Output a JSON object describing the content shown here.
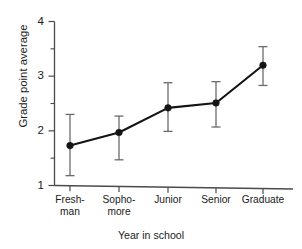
{
  "chart_data": {
    "type": "line",
    "title": "",
    "xlabel": "Year in school",
    "ylabel": "Grade point average",
    "categories": [
      "Fresh-\nman",
      "Sopho-\nmore",
      "Junior",
      "Senior",
      "Graduate"
    ],
    "categories_flat": [
      "Freshman",
      "Sophomore",
      "Junior",
      "Senior",
      "Graduate"
    ],
    "values": [
      1.73,
      1.97,
      2.42,
      2.51,
      3.2
    ],
    "error_low": [
      1.18,
      1.47,
      1.99,
      2.07,
      2.83
    ],
    "error_high": [
      2.3,
      2.27,
      2.88,
      2.9,
      3.54
    ],
    "ylim": [
      1,
      4
    ],
    "xlim": [
      0,
      6
    ],
    "ytick_labels": [
      "1",
      "2",
      "3",
      "4"
    ],
    "ytick_values": [
      1,
      2,
      3,
      4
    ],
    "yminor_values": [
      1.5,
      2.5,
      3.5
    ],
    "grid": false,
    "legend": null,
    "legend_position": "none",
    "series": [
      {
        "name": "Grade point average",
        "values": [
          1.73,
          1.97,
          2.42,
          2.51,
          3.2
        ],
        "error_low": [
          1.18,
          1.47,
          1.99,
          2.07,
          2.83
        ],
        "error_high": [
          2.3,
          2.27,
          2.88,
          2.9,
          3.54
        ],
        "marker": "filled-circle",
        "color": "#141414"
      }
    ],
    "colors": {
      "line": "#141414",
      "marker": "#141414",
      "error_bar": "#6b6b6b",
      "axis": "#4a4a4a",
      "background": "#ffffff",
      "text": "#1a1a1a"
    }
  }
}
